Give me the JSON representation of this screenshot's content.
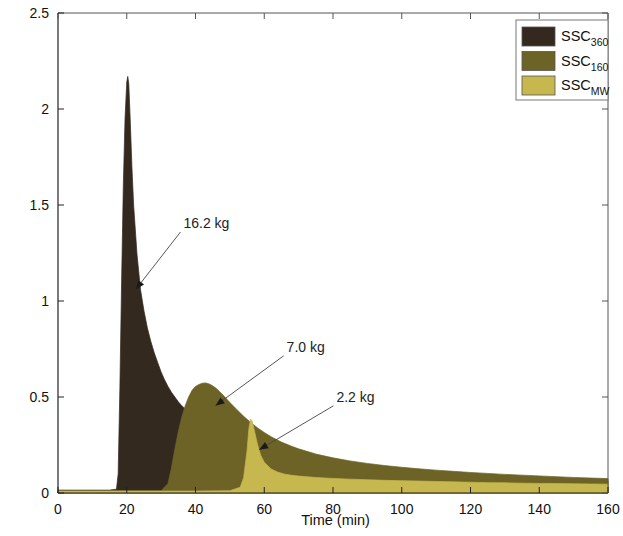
{
  "chart_data": {
    "type": "area",
    "title": "",
    "xlabel": "Time (min)",
    "ylabel_text": "Suspended sediment concentration (g · l",
    "ylabel_sup": "-1",
    "ylabel_tail": ")",
    "xlim": [
      0,
      160
    ],
    "ylim": [
      0,
      2.5
    ],
    "xticks": [
      0,
      20,
      40,
      60,
      80,
      100,
      120,
      140,
      160
    ],
    "xtick_labels": [
      "0",
      "20",
      "40",
      "60",
      "80",
      "100",
      "120",
      "140",
      "160"
    ],
    "yticks": [
      0,
      0.5,
      1,
      1.5,
      2,
      2.5
    ],
    "ytick_labels": [
      "0",
      "0.5",
      "1",
      "1.5",
      "2",
      "2.5"
    ],
    "grid": false,
    "legend_position": "top-right",
    "colors": {
      "ssc360": "#342a20",
      "ssc160": "#6e6326",
      "sscmw": "#c3b košar"
    },
    "series": [
      {
        "name": "SSC_360",
        "label_base": "SSC",
        "label_sub": "360",
        "color": "#33291f",
        "mass_kg": "16.2 kg",
        "x": [
          0,
          5,
          10,
          15,
          17,
          17.5,
          18,
          18.5,
          19,
          19.5,
          20,
          20.3,
          20.6,
          21,
          21.5,
          22,
          23,
          24,
          25,
          26,
          27,
          28,
          29,
          30,
          31,
          32,
          33,
          34,
          35,
          36,
          38,
          40,
          43,
          46,
          50,
          55,
          60,
          65,
          70,
          75,
          80,
          85,
          90,
          95,
          100,
          105,
          110,
          115,
          120,
          125,
          130,
          135,
          140,
          145,
          150,
          155,
          160
        ],
        "y": [
          0.015,
          0.015,
          0.015,
          0.015,
          0.02,
          0.1,
          0.55,
          1.1,
          1.6,
          1.95,
          2.14,
          2.17,
          2.13,
          1.95,
          1.7,
          1.5,
          1.24,
          1.06,
          0.95,
          0.86,
          0.79,
          0.73,
          0.68,
          0.63,
          0.59,
          0.555,
          0.525,
          0.5,
          0.475,
          0.455,
          0.42,
          0.39,
          0.35,
          0.32,
          0.285,
          0.25,
          0.225,
          0.205,
          0.19,
          0.175,
          0.163,
          0.152,
          0.142,
          0.133,
          0.125,
          0.117,
          0.11,
          0.104,
          0.098,
          0.093,
          0.088,
          0.083,
          0.079,
          0.075,
          0.071,
          0.068,
          0.065
        ]
      },
      {
        "name": "SSC_160",
        "label_base": "SSC",
        "label_sub": "160",
        "color": "#6e6326",
        "mass_kg": "7.0 kg",
        "x": [
          0,
          10,
          20,
          30,
          32,
          33,
          34,
          35,
          36,
          37,
          38,
          39,
          40,
          41,
          42,
          43,
          44,
          45,
          46,
          47,
          48,
          50,
          52,
          54,
          56,
          58,
          60,
          62,
          65,
          68,
          70,
          75,
          80,
          85,
          90,
          95,
          100,
          105,
          110,
          115,
          120,
          125,
          130,
          135,
          140,
          145,
          150,
          155,
          160
        ],
        "y": [
          0.012,
          0.012,
          0.012,
          0.012,
          0.05,
          0.13,
          0.23,
          0.32,
          0.395,
          0.455,
          0.5,
          0.535,
          0.555,
          0.565,
          0.572,
          0.573,
          0.568,
          0.558,
          0.545,
          0.528,
          0.51,
          0.472,
          0.435,
          0.4,
          0.368,
          0.34,
          0.315,
          0.293,
          0.265,
          0.243,
          0.23,
          0.203,
          0.183,
          0.167,
          0.154,
          0.143,
          0.134,
          0.126,
          0.119,
          0.113,
          0.107,
          0.102,
          0.097,
          0.093,
          0.089,
          0.085,
          0.081,
          0.078,
          0.075
        ]
      },
      {
        "name": "SSC_MW",
        "label_base": "SSC",
        "label_sub": "MW",
        "color": "#c6b84f",
        "mass_kg": "2.2 kg",
        "x": [
          0,
          10,
          20,
          30,
          40,
          50,
          53,
          54,
          55,
          55.5,
          56,
          56.5,
          57,
          58,
          59,
          60,
          62,
          64,
          66,
          68,
          70,
          75,
          80,
          85,
          90,
          95,
          100,
          105,
          110,
          115,
          120,
          125,
          130,
          135,
          140,
          145,
          150,
          155,
          160
        ],
        "y": [
          0.01,
          0.01,
          0.01,
          0.01,
          0.01,
          0.012,
          0.03,
          0.08,
          0.22,
          0.33,
          0.385,
          0.375,
          0.335,
          0.255,
          0.195,
          0.16,
          0.125,
          0.108,
          0.098,
          0.092,
          0.088,
          0.081,
          0.076,
          0.072,
          0.069,
          0.066,
          0.064,
          0.062,
          0.06,
          0.058,
          0.056,
          0.054,
          0.053,
          0.051,
          0.05,
          0.049,
          0.048,
          0.047,
          0.046
        ]
      }
    ],
    "annotations": [
      {
        "text": "16.2 kg",
        "text_x": 36.5,
        "text_y": 1.38,
        "tip_x": 22.6,
        "tip_y": 1.06
      },
      {
        "text": "7.0 kg",
        "text_x": 66.5,
        "text_y": 0.735,
        "tip_x": 45.8,
        "tip_y": 0.455
      },
      {
        "text": "2.2 kg",
        "text_x": 81.0,
        "text_y": 0.475,
        "tip_x": 58.5,
        "tip_y": 0.225
      }
    ]
  },
  "legend": {
    "entries": [
      {
        "base": "SSC",
        "sub": "360"
      },
      {
        "base": "SSC",
        "sub": "160"
      },
      {
        "base": "SSC",
        "sub": "MW"
      }
    ]
  }
}
